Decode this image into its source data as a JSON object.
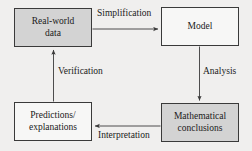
{
  "diagram": {
    "type": "flow-cycle",
    "background_color": "#f0efee",
    "border_color": "#3a3a3a",
    "shaded_fill": "#d3d3d3",
    "plain_fill": "#f7f7f6",
    "nodes": [
      {
        "id": "real-world-data",
        "label": "Real-world\ndata",
        "fill": "shaded",
        "position": "top-left"
      },
      {
        "id": "model",
        "label": "Model",
        "fill": "plain",
        "position": "top-right"
      },
      {
        "id": "mathematical-conclusions",
        "label": "Mathematical\nconclusions",
        "fill": "shaded",
        "position": "bottom-right"
      },
      {
        "id": "predictions-explanations",
        "label": "Predictions/\nexplanations",
        "fill": "plain",
        "position": "bottom-left"
      }
    ],
    "edges": [
      {
        "id": "simplification",
        "label": "Simplification",
        "from": "real-world-data",
        "to": "model",
        "direction": "right"
      },
      {
        "id": "analysis",
        "label": "Analysis",
        "from": "model",
        "to": "mathematical-conclusions",
        "direction": "down"
      },
      {
        "id": "interpretation",
        "label": "Interpretation",
        "from": "mathematical-conclusions",
        "to": "predictions-explanations",
        "direction": "left"
      },
      {
        "id": "verification",
        "label": "Verification",
        "from": "predictions-explanations",
        "to": "real-world-data",
        "direction": "up"
      }
    ]
  }
}
